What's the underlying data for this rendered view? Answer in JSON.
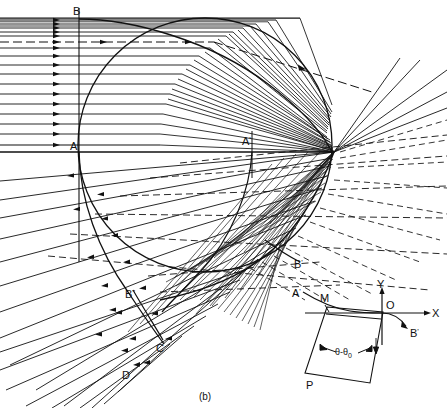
{
  "figure": {
    "caption": "(b)",
    "title": "",
    "type": "optical-ray-caustic-diagram",
    "background_color": "#ffffff",
    "line_color": "#111111"
  },
  "main_diagram": {
    "name": "caustic-ray-diagram",
    "circle": {
      "label": "refracting-circle",
      "cx": 205,
      "cy": 145,
      "r": 127,
      "stroke": "#111111"
    },
    "labels": [
      {
        "id": "B",
        "text": "B",
        "prime": "",
        "x": 78,
        "y": 14
      },
      {
        "id": "A",
        "text": "A",
        "prime": "",
        "x": 72,
        "y": 150
      },
      {
        "id": "Ap",
        "text": "A",
        "prime": "'",
        "x": 243,
        "y": 144
      },
      {
        "id": "Bp",
        "text": "B",
        "prime": "'",
        "x": 297,
        "y": 266
      },
      {
        "id": "Bpp",
        "text": "B",
        "prime": "\"",
        "x": 129,
        "y": 296
      },
      {
        "id": "C",
        "text": "C",
        "prime": "",
        "x": 158,
        "y": 350
      },
      {
        "id": "D",
        "text": "D",
        "prime": "",
        "x": 124,
        "y": 377
      }
    ],
    "incident_rays": {
      "description": "parallel-incident-rays",
      "count": 19,
      "direction": "left-to-right",
      "arrow_x": 57,
      "start_x": 0,
      "top_y": 20,
      "bottom_y": 152
    },
    "dashed_ray": {
      "description": "dashed-axis-ray",
      "y": 42
    },
    "outgoing_rays": {
      "description": "refracted-divergent-rays",
      "count": 12,
      "direction": "right-to-left-down"
    },
    "caustic": {
      "description": "caustic-envelope-curve",
      "cusp_x": 332,
      "cusp_y": 152
    }
  },
  "inset_diagram": {
    "name": "coordinate-inset",
    "origin": {
      "x": 382,
      "y": 313
    },
    "axes": [
      {
        "id": "X",
        "label": "X",
        "label_x": 434,
        "label_y": 313
      },
      {
        "id": "Y",
        "label": "Y",
        "label_x": 380,
        "label_y": 288
      }
    ],
    "labels": [
      {
        "id": "origin",
        "text": "O",
        "prime": "",
        "x": 386,
        "y": 308
      },
      {
        "id": "Ap",
        "text": "A",
        "prime": "'",
        "x": 296,
        "y": 297
      },
      {
        "id": "M",
        "text": "M",
        "prime": "",
        "x": 324,
        "y": 303
      },
      {
        "id": "Bp",
        "text": "B",
        "prime": "'",
        "x": 413,
        "y": 334
      },
      {
        "id": "P",
        "text": "P",
        "prime": "",
        "x": 309,
        "y": 386
      }
    ],
    "angle_annotation": {
      "text": "θ-θ",
      "subscript": "0",
      "x": 337,
      "y": 354
    },
    "prism": {
      "description": "tilted-prism-rectangle"
    }
  }
}
